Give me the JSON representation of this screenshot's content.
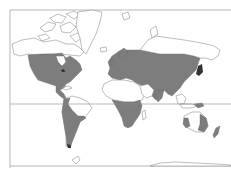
{
  "map": {
    "type": "world-distribution-map",
    "projection": "mercator",
    "colors": {
      "background": "#ffffff",
      "land_outline": "#7a7a7a",
      "distribution_shade": "#7d7d7d",
      "frame": "#9a9a9a"
    },
    "features": {
      "equator_line": true,
      "frame_lines": [
        "top",
        "left",
        "bottom"
      ]
    },
    "shaded_regions": [
      "North America (USA, southern Canada, Mexico)",
      "Central America",
      "South America (western and southern)",
      "Europe",
      "Northern Asia / Russia",
      "Central and East Asia",
      "India",
      "Sub-Saharan Africa",
      "Japan",
      "Philippines",
      "Southwestern and eastern Australia",
      "New Zealand"
    ],
    "unshaded_regions": [
      "Arctic Canada",
      "Greenland",
      "Iceland",
      "Sahara / North Africa",
      "Arabia",
      "Amazon / Brazil",
      "Central Australia",
      "Antarctica"
    ]
  }
}
